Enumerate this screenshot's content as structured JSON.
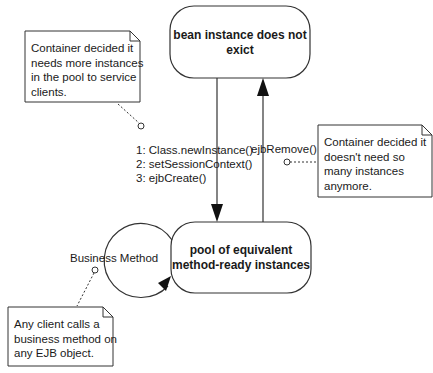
{
  "diagram": {
    "type": "state-diagram",
    "colors": {
      "line": "#333333",
      "background": "#ffffff",
      "text": "#1a1a1a"
    },
    "states": [
      {
        "id": "does-not-exist",
        "label_line1": "bean instance does not",
        "label_line2": "exict"
      },
      {
        "id": "pool",
        "label_line1": "pool of equivalent",
        "label_line2": "method-ready instances"
      }
    ],
    "transitions": {
      "create": {
        "from": "does-not-exist",
        "to": "pool",
        "steps": [
          "1: Class.newInstance()",
          "2: setSessionContext()",
          "3: ejbCreate()"
        ]
      },
      "remove": {
        "from": "pool",
        "to": "does-not-exist",
        "label": "ejbRemove()"
      },
      "business": {
        "from": "pool",
        "to": "pool",
        "label": "Business Method"
      }
    },
    "notes": [
      {
        "id": "note-create",
        "lines": [
          "Container decided it",
          "needs more instances",
          "in the pool to service",
          "clients."
        ]
      },
      {
        "id": "note-remove",
        "lines": [
          "Container decided it",
          "doesn't need so",
          "many instances",
          "anymore."
        ]
      },
      {
        "id": "note-business",
        "lines": [
          "Any client calls a",
          "business method on",
          "any EJB object."
        ]
      }
    ]
  }
}
